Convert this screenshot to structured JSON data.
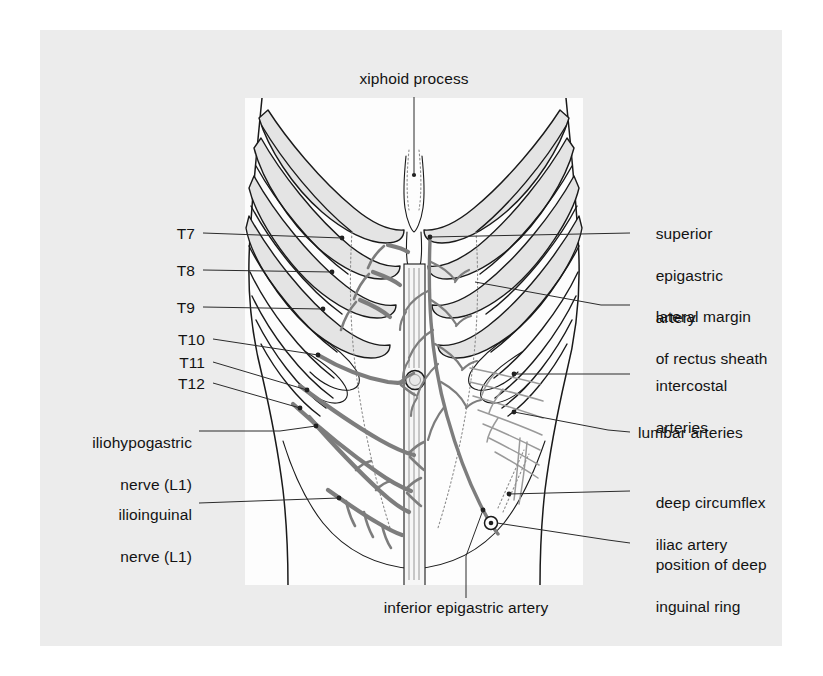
{
  "figure": {
    "paper_color": "#ececec",
    "panel_color": "#fdfdfd",
    "vessel_color": "#7b7b7b",
    "outline_color": "#1a1a1a",
    "rib_fill_color": "#e2e2e2",
    "leader_color": "#2b2b2b"
  },
  "labels": {
    "top": {
      "xiphoid_process": "xiphoid process"
    },
    "bottom": {
      "inferior_epigastric_artery": "inferior epigastric artery"
    },
    "left": [
      {
        "id": "t7",
        "text": "T7"
      },
      {
        "id": "t8",
        "text": "T8"
      },
      {
        "id": "t9",
        "text": "T9"
      },
      {
        "id": "t10",
        "text": "T10"
      },
      {
        "id": "t11",
        "text": "T11"
      },
      {
        "id": "t12",
        "text": "T12"
      },
      {
        "id": "iliohypogastric",
        "line1": "iliohypogastric",
        "line2": "nerve (L1)"
      },
      {
        "id": "ilioinguinal",
        "line1": "ilioinguinal",
        "line2": "nerve (L1)"
      }
    ],
    "right": [
      {
        "id": "superior-epigastric-artery",
        "line1": "superior",
        "line2": "epigastric",
        "line3": "artery"
      },
      {
        "id": "lateral-margin-rectus-sheath",
        "line1": "lateral margin",
        "line2": "of rectus sheath"
      },
      {
        "id": "intercostal-arteries",
        "line1": "intercostal",
        "line2": "arteries"
      },
      {
        "id": "lumbar-arteries",
        "line1": "lumbar arteries"
      },
      {
        "id": "deep-circumflex-iliac-artery",
        "line1": "deep circumflex",
        "line2": "iliac artery"
      },
      {
        "id": "position-of-deep-inguinal-ring",
        "line1": "position of deep",
        "line2": "inguinal ring"
      }
    ]
  }
}
